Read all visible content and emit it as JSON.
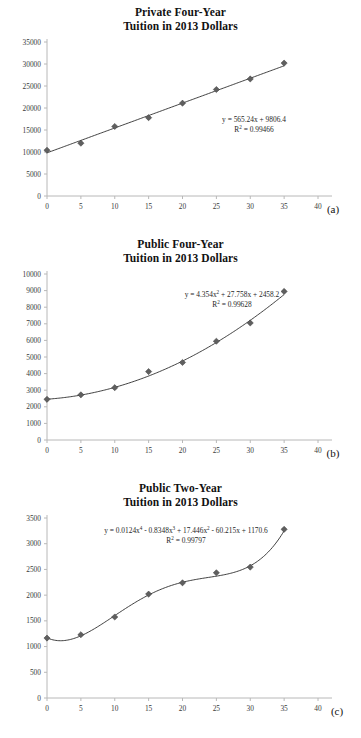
{
  "figure": {
    "panels": [
      {
        "id": "a",
        "letter": "(a)",
        "title_line1": "Private Four-Year",
        "title_line2": "Tuition in 2013 Dollars",
        "equation": "y = 565.24x + 9806.4",
        "r_squared_label": "R",
        "r_squared_sup": "2",
        "r_squared_value": " = 0.99466"
      },
      {
        "id": "b",
        "letter": "(b)",
        "title_line1": "Public Four-Year",
        "title_line2": "Tuition in 2013 Dollars",
        "equation_pre": "y = 4.354x",
        "equation_sup1": "2",
        "equation_mid": " + 27.758x + 2458.2",
        "r_squared_label": "R",
        "r_squared_sup": "2",
        "r_squared_value": " = 0.99628"
      },
      {
        "id": "c",
        "letter": "(c)",
        "title_line1": "Public Two-Year",
        "title_line2": "Tuition in 2013 Dollars",
        "equation_p1": "y = 0.0124x",
        "equation_s1": "4",
        "equation_p2": " - 0.8348x",
        "equation_s2": "3",
        "equation_p3": " + 17.446x",
        "equation_s3": "2",
        "equation_p4": " - 60.215x + 1170.6",
        "r_squared_label": "R",
        "r_squared_sup": "2",
        "r_squared_value": " = 0.99797"
      }
    ]
  },
  "chart_data": [
    {
      "type": "scatter",
      "panel": "a",
      "title": "Private Four-Year Tuition in 2013 Dollars",
      "xlabel": "",
      "ylabel": "",
      "xlim": [
        0,
        40
      ],
      "ylim": [
        0,
        35000
      ],
      "xticks": [
        0,
        5,
        10,
        15,
        20,
        25,
        30,
        35,
        40
      ],
      "yticks": [
        0,
        5000,
        10000,
        15000,
        20000,
        25000,
        30000,
        35000
      ],
      "xtick_labels": [
        "0",
        "5",
        "10",
        "15",
        "20",
        "25",
        "30",
        "35",
        "40"
      ],
      "ytick_labels": [
        "0",
        "5000",
        "10000",
        "15000",
        "20000",
        "25000",
        "30000",
        "35000"
      ],
      "grid": false,
      "legend": false,
      "x": [
        0,
        5,
        10,
        15,
        20,
        25,
        30,
        35
      ],
      "values": [
        10400,
        12000,
        15800,
        17800,
        21100,
        24200,
        26600,
        30200
      ],
      "trendline": {
        "kind": "linear",
        "equation": "y = 565.24x + 9806.4",
        "coefficients": [
          565.24,
          9806.4
        ],
        "r_squared": 0.99466
      },
      "marker": "diamond",
      "marker_color": "#5f5f5f",
      "line_color": "#2b2b2b"
    },
    {
      "type": "scatter",
      "panel": "b",
      "title": "Public Four-Year Tuition in 2013 Dollars",
      "xlabel": "",
      "ylabel": "",
      "xlim": [
        0,
        40
      ],
      "ylim": [
        0,
        10000
      ],
      "xticks": [
        0,
        5,
        10,
        15,
        20,
        25,
        30,
        35,
        40
      ],
      "yticks": [
        0,
        1000,
        2000,
        3000,
        4000,
        5000,
        6000,
        7000,
        8000,
        9000,
        10000
      ],
      "xtick_labels": [
        "0",
        "5",
        "10",
        "15",
        "20",
        "25",
        "30",
        "35",
        "40"
      ],
      "ytick_labels": [
        "0",
        "1000",
        "2000",
        "3000",
        "4000",
        "5000",
        "6000",
        "7000",
        "8000",
        "9000",
        "10000"
      ],
      "grid": false,
      "legend": false,
      "x": [
        0,
        5,
        10,
        15,
        20,
        25,
        30,
        35
      ],
      "values": [
        2450,
        2720,
        3150,
        4120,
        4670,
        5950,
        7050,
        8950
      ],
      "trendline": {
        "kind": "quadratic",
        "equation": "y = 4.354x^2 + 27.758x + 2458.2",
        "coefficients": [
          4.354,
          27.758,
          2458.2
        ],
        "r_squared": 0.99628
      },
      "marker": "diamond",
      "marker_color": "#5f5f5f",
      "line_color": "#2b2b2b"
    },
    {
      "type": "scatter",
      "panel": "c",
      "title": "Public Two-Year Tuition in 2013 Dollars",
      "xlabel": "",
      "ylabel": "",
      "xlim": [
        0,
        40
      ],
      "ylim": [
        0,
        3500
      ],
      "xticks": [
        0,
        5,
        10,
        15,
        20,
        25,
        30,
        35,
        40
      ],
      "yticks": [
        0,
        500,
        1000,
        1500,
        2000,
        2500,
        3000,
        3500
      ],
      "xtick_labels": [
        "0",
        "5",
        "10",
        "15",
        "20",
        "25",
        "30",
        "35",
        "40"
      ],
      "ytick_labels": [
        "0",
        "500",
        "1000",
        "1500",
        "2000",
        "2500",
        "3000",
        "3500"
      ],
      "grid": false,
      "legend": false,
      "x": [
        0,
        5,
        10,
        15,
        20,
        25,
        30,
        35
      ],
      "values": [
        1165,
        1230,
        1575,
        2020,
        2240,
        2435,
        2545,
        3280
      ],
      "trendline": {
        "kind": "quartic",
        "equation": "y = 0.0124x^4 - 0.8348x^3 + 17.446x^2 - 60.215x + 1170.6",
        "coefficients": [
          0.0124,
          -0.8348,
          17.446,
          -60.215,
          1170.6
        ],
        "r_squared": 0.99797
      },
      "marker": "diamond",
      "marker_color": "#5f5f5f",
      "line_color": "#2b2b2b"
    }
  ]
}
